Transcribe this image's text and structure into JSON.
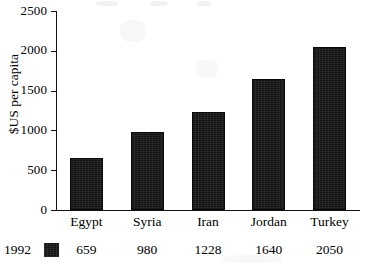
{
  "chart_data": {
    "type": "bar",
    "title": "",
    "xlabel": "",
    "ylabel": "$US per capita",
    "categories": [
      "Egypt",
      "Syria",
      "Iran",
      "Jordan",
      "Turkey"
    ],
    "values": [
      659,
      980,
      1228,
      1640,
      2050
    ],
    "series": [
      {
        "name": "1992",
        "values": [
          659,
          980,
          1228,
          1640,
          2050
        ]
      }
    ],
    "ylim": [
      0,
      2500
    ],
    "yticks": [
      0,
      500,
      1000,
      1500,
      2000,
      2500
    ],
    "ytick_labels": [
      "0",
      "500",
      "1000",
      "1500",
      "2000",
      "2500"
    ],
    "grid": false,
    "legend_position": "bottom-left",
    "bar_color": "#141414",
    "axis_color": "#111111",
    "background_color": "#ffffff"
  },
  "legend": {
    "series_label": "1992",
    "swatch_color": "#141414",
    "data_labels": [
      "659",
      "980",
      "1228",
      "1640",
      "2050"
    ]
  }
}
